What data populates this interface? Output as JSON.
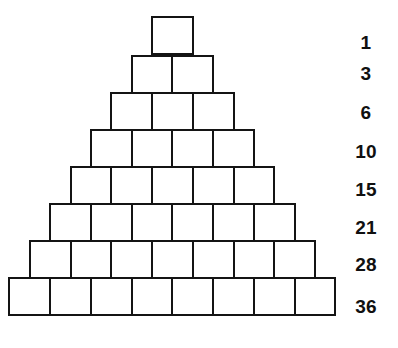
{
  "figure": {
    "type": "block-pyramid-diagram",
    "background_color": "#ffffff",
    "stroke_color": "#141414",
    "fill_color": "#ffffff",
    "stroke_width_px": 2,
    "block_width_px": 40.75,
    "block_height_px": 37,
    "rows_count": 8,
    "bottom_row_left_px": 14,
    "bottom_row_bottom_px": 332
  },
  "chart_data": {
    "type": "bar",
    "title": "",
    "xlabel": "",
    "ylabel": "",
    "grid": false,
    "legend": null,
    "categories": [
      "row 1",
      "row 2",
      "row 3",
      "row 4",
      "row 5",
      "row 6",
      "row 7",
      "row 8"
    ],
    "values": [
      1,
      2,
      3,
      4,
      5,
      6,
      7,
      8
    ],
    "series": [
      {
        "name": "blocks in row",
        "values": [
          1,
          2,
          3,
          4,
          5,
          6,
          7,
          8
        ]
      },
      {
        "name": "cumulative total",
        "values": [
          1,
          3,
          6,
          10,
          15,
          21,
          28,
          36
        ]
      }
    ],
    "annotations": [
      "1",
      "3",
      "6",
      "10",
      "15",
      "21",
      "28",
      "36"
    ]
  },
  "rows": [
    {
      "index": 1,
      "blocks": 1,
      "cumulative_label": "1",
      "top_px": 17,
      "left_px": 152.0
    },
    {
      "index": 2,
      "blocks": 2,
      "cumulative_label": "3",
      "top_px": 56,
      "left_px": 131.6
    },
    {
      "index": 3,
      "blocks": 3,
      "cumulative_label": "6",
      "top_px": 93,
      "left_px": 111.3
    },
    {
      "index": 4,
      "blocks": 4,
      "cumulative_label": "10",
      "top_px": 130,
      "left_px": 90.9
    },
    {
      "index": 5,
      "blocks": 5,
      "cumulative_label": "15",
      "top_px": 167,
      "left_px": 70.5
    },
    {
      "index": 6,
      "blocks": 6,
      "cumulative_label": "21",
      "top_px": 204,
      "left_px": 50.1
    },
    {
      "index": 7,
      "blocks": 7,
      "cumulative_label": "28",
      "top_px": 241,
      "left_px": 29.8
    },
    {
      "index": 8,
      "blocks": 8,
      "cumulative_label": "36",
      "top_px": 278,
      "left_px": 9.4
    }
  ],
  "labels": [
    {
      "text": "1",
      "center_y_px": 43
    },
    {
      "text": "3",
      "center_y_px": 74
    },
    {
      "text": "6",
      "center_y_px": 113
    },
    {
      "text": "10",
      "center_y_px": 152
    },
    {
      "text": "15",
      "center_y_px": 190
    },
    {
      "text": "21",
      "center_y_px": 228
    },
    {
      "text": "28",
      "center_y_px": 265
    },
    {
      "text": "36",
      "center_y_px": 307
    }
  ]
}
